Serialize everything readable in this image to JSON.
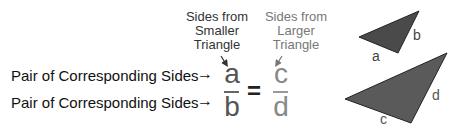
{
  "rows": [
    {
      "label": "Pair of Corresponding Sides",
      "arrow": "→"
    },
    {
      "label": "Pair of Corresponding Sides",
      "arrow": "→"
    }
  ],
  "captions": {
    "smaller": [
      "Sides from",
      "Smaller",
      "Triangle"
    ],
    "larger": [
      "Sides from",
      "Larger",
      "Triangle"
    ]
  },
  "fraction_left": {
    "numerator": "a",
    "denominator": "b"
  },
  "equals": "=",
  "fraction_right": {
    "numerator": "c",
    "denominator": "d"
  },
  "triangles": {
    "small": {
      "labels": [
        "a",
        "b"
      ],
      "fill": "#4a4a4a"
    },
    "large": {
      "labels": [
        "c",
        "d"
      ],
      "fill": "#5a5a5a"
    }
  },
  "colors": {
    "text_dark": "#111111",
    "caption_small": "#333333",
    "caption_large": "#777777",
    "triangle_stroke": "#222222"
  }
}
